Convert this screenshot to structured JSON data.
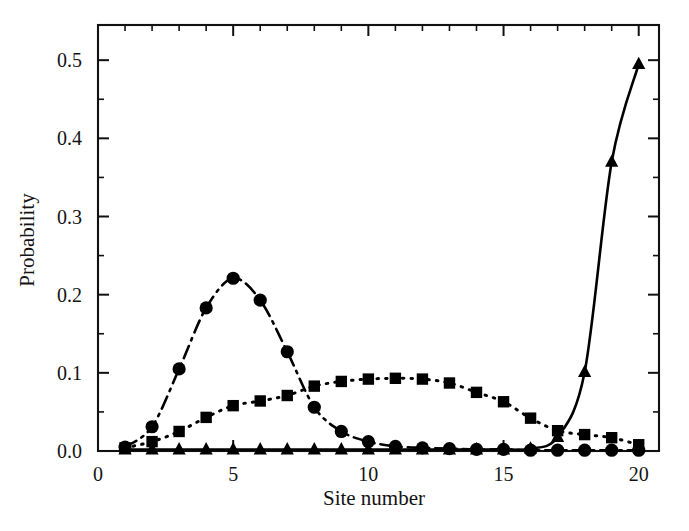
{
  "chart_data": {
    "type": "line",
    "title": "",
    "xlabel": "Site number",
    "ylabel": "Probability",
    "xlim": [
      0,
      20.75
    ],
    "ylim": [
      0.0,
      0.545
    ],
    "grid": false,
    "legend": "none",
    "x_ticks_major": [
      0,
      5,
      10,
      15,
      20
    ],
    "x_tick_labels": [
      "0",
      "5",
      "10",
      "15",
      "20"
    ],
    "x_ticks_minor": [
      1,
      2,
      3,
      4,
      6,
      7,
      8,
      9,
      11,
      12,
      13,
      14,
      16,
      17,
      18,
      19
    ],
    "y_ticks_major": [
      0.0,
      0.1,
      0.2,
      0.3,
      0.4,
      0.5
    ],
    "y_tick_labels": [
      "0.0",
      "0.1",
      "0.2",
      "0.3",
      "0.4",
      "0.5"
    ],
    "y_ticks_minor": [
      0.05,
      0.15,
      0.25,
      0.35,
      0.45
    ],
    "x": [
      1,
      2,
      3,
      4,
      5,
      6,
      7,
      8,
      9,
      10,
      11,
      12,
      13,
      14,
      15,
      16,
      17,
      18,
      19,
      20
    ],
    "series": [
      {
        "name": "circle-series",
        "marker": "circle",
        "linestyle": "dash-dot",
        "color": "#000000",
        "values": [
          0.005,
          0.031,
          0.105,
          0.183,
          0.221,
          0.193,
          0.127,
          0.056,
          0.025,
          0.012,
          0.006,
          0.004,
          0.003,
          0.002,
          0.002,
          0.001,
          0.001,
          0.001,
          0.001,
          0.001
        ]
      },
      {
        "name": "square-series",
        "marker": "square",
        "linestyle": "dotted",
        "color": "#000000",
        "values": [
          0.004,
          0.012,
          0.025,
          0.043,
          0.058,
          0.064,
          0.071,
          0.083,
          0.089,
          0.092,
          0.093,
          0.092,
          0.087,
          0.075,
          0.063,
          0.042,
          0.026,
          0.021,
          0.017,
          0.008
        ]
      },
      {
        "name": "triangle-series",
        "marker": "triangle",
        "linestyle": "solid",
        "color": "#000000",
        "values": [
          0.002,
          0.002,
          0.002,
          0.002,
          0.002,
          0.002,
          0.002,
          0.002,
          0.002,
          0.002,
          0.002,
          0.002,
          0.002,
          0.002,
          0.002,
          0.003,
          0.018,
          0.101,
          0.37,
          0.495
        ]
      }
    ]
  }
}
